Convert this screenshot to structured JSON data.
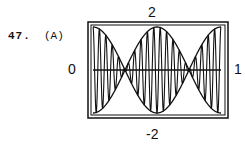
{
  "problem": {
    "number": "47.",
    "option": "(A)"
  },
  "chart_data": {
    "type": "line",
    "title": "",
    "xlabel": "",
    "ylabel": "",
    "xlim": [
      0,
      1
    ],
    "ylim": [
      -2,
      2
    ],
    "tick_labels": {
      "top": "2",
      "bottom": "-2",
      "left": "0",
      "right": "1"
    },
    "grid": false,
    "series": [
      {
        "name": "upper envelope",
        "formula": "2cos(2πx)"
      },
      {
        "name": "lower envelope",
        "formula": "-2cos(2πx)"
      },
      {
        "name": "signal",
        "formula": "2cos(2πx)·cos(40πx)"
      },
      {
        "name": "x-axis",
        "formula": "0"
      }
    ]
  }
}
